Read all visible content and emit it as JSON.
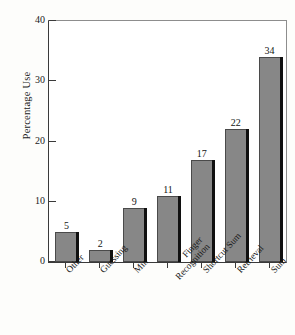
{
  "chart_data": {
    "type": "bar",
    "title": "",
    "xlabel": "",
    "ylabel": "Percentage Use",
    "categories": [
      "Other",
      "Guessing",
      "Min",
      "Finger Recognition",
      "Shortcut Sum",
      "Retrieval",
      "Sum"
    ],
    "category_lines": [
      [
        "Other"
      ],
      [
        "Guessing"
      ],
      [
        "Min"
      ],
      [
        "Finger",
        "Recognition"
      ],
      [
        "Shortcut Sum"
      ],
      [
        "Retrieval"
      ],
      [
        "Sum"
      ]
    ],
    "values": [
      5,
      2,
      9,
      11,
      17,
      22,
      34
    ],
    "value_labels": [
      "5",
      "2",
      "9",
      "11",
      "17",
      "22",
      "34"
    ],
    "ylim": [
      0,
      40
    ],
    "yticks": [
      0,
      10,
      20,
      30,
      40
    ],
    "ytick_labels": [
      "0",
      "10",
      "20",
      "30",
      "40"
    ],
    "grid": false,
    "legend": null,
    "bar_color": "#878787",
    "bar_shadow_color": "#101010",
    "axis_color": "#3a3a3a",
    "background_color": "#fdfdfb"
  }
}
